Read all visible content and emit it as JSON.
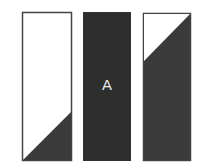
{
  "diagram": {
    "panels": [
      {
        "name": "left-panel",
        "fill": "mostly-white",
        "shaded_region": "bottom-right triangle"
      },
      {
        "name": "middle-panel",
        "fill": "solid-dark",
        "label": "A"
      },
      {
        "name": "right-panel",
        "fill": "mostly-dark",
        "unshaded_region": "top-left triangle"
      }
    ],
    "colors": {
      "dark": "#2e2e2e",
      "border": "#444444",
      "light": "#ffffff"
    }
  }
}
